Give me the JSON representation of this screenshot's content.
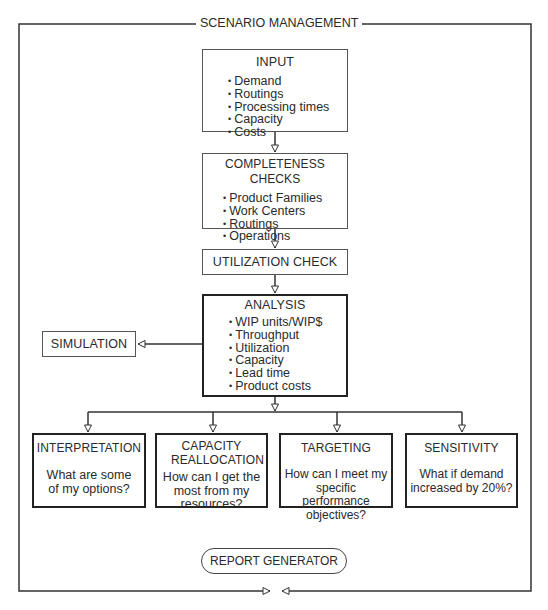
{
  "frame": {
    "title": "SCENARIO MANAGEMENT"
  },
  "input": {
    "title": "INPUT",
    "items": [
      "Demand",
      "Routings",
      "Processing times",
      "Capacity",
      "Costs"
    ]
  },
  "completeness": {
    "title": "COMPLETENESS CHECKS",
    "items": [
      "Product Families",
      "Work Centers",
      "Routings",
      "Operations"
    ]
  },
  "utilization": {
    "title": "UTILIZATION CHECK"
  },
  "analysis": {
    "title": "ANALYSIS",
    "items": [
      "WIP units/WIP$",
      "Throughput",
      "Utilization",
      "Capacity",
      "Lead time",
      "Product costs"
    ]
  },
  "simulation": {
    "title": "SIMULATION"
  },
  "outcomes": [
    {
      "title": "INTERPRETATION",
      "question": "What are some of my options?"
    },
    {
      "title": "CAPACITY REALLOCATION",
      "question": "How can I get the most from my resources?"
    },
    {
      "title": "TARGETING",
      "question": "How can I meet my specific performance objectives?"
    },
    {
      "title": "SENSITIVITY",
      "question": "What if demand increased by 20%?"
    }
  ],
  "report": {
    "title": "REPORT GENERATOR"
  },
  "colors": {
    "line": "#333333",
    "background": "#ffffff",
    "text": "#2a2a2a"
  }
}
